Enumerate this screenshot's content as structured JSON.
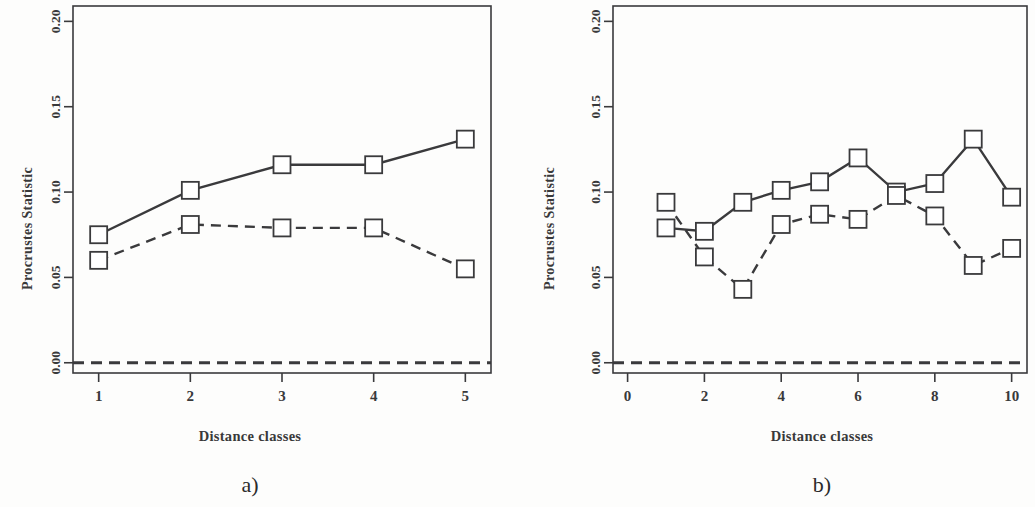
{
  "figure": {
    "background_color": "#fdfdfc",
    "ink_color": "#3a3a3c"
  },
  "panel_a": {
    "caption": "a)",
    "ylabel": "Procrustes Statistic",
    "xlabel": "Distance classes"
  },
  "panel_b": {
    "caption": "b)",
    "ylabel": "Procrustes Statistic",
    "xlabel": "Distance classes"
  },
  "chart_data": [
    {
      "type": "line",
      "panel": "a)",
      "title": "",
      "xlabel": "Distance classes",
      "ylabel": "Procrustes Statistic",
      "x": [
        1,
        2,
        3,
        4,
        5
      ],
      "xlim": [
        0.72,
        5.28
      ],
      "ylim": [
        -0.006,
        0.209
      ],
      "xticks": [
        1,
        2,
        3,
        4,
        5
      ],
      "xticklabels": [
        "1",
        "2",
        "3",
        "4",
        "5"
      ],
      "yticks": [
        0.0,
        0.05,
        0.1,
        0.15,
        0.2
      ],
      "yticklabels": [
        "0.00",
        "0.05",
        "0.10",
        "0.15",
        "0.20"
      ],
      "grid": false,
      "legend": "none",
      "marker": "open-square",
      "series": [
        {
          "name": "solid-series",
          "linestyle": "solid",
          "values": [
            0.075,
            0.101,
            0.116,
            0.116,
            0.131
          ]
        },
        {
          "name": "dashed-series",
          "linestyle": "dashed",
          "values": [
            0.06,
            0.081,
            0.079,
            0.079,
            0.055
          ]
        },
        {
          "name": "zero-reference-line",
          "linestyle": "dashed",
          "markers": false,
          "values": [
            0.0,
            0.0,
            0.0,
            0.0,
            0.0
          ]
        }
      ]
    },
    {
      "type": "line",
      "panel": "b)",
      "title": "",
      "xlabel": "Distance classes",
      "ylabel": "Procrustes Statistic",
      "x": [
        1,
        2,
        3,
        4,
        5,
        6,
        7,
        8,
        9,
        10
      ],
      "xlim": [
        -0.38,
        10.4
      ],
      "ylim": [
        -0.006,
        0.209
      ],
      "xticks": [
        0,
        2,
        4,
        6,
        8,
        10
      ],
      "xticklabels": [
        "0",
        "2",
        "4",
        "6",
        "8",
        "10"
      ],
      "yticks": [
        0.0,
        0.05,
        0.1,
        0.15,
        0.2
      ],
      "yticklabels": [
        "0.00",
        "0.05",
        "0.10",
        "0.15",
        "0.20"
      ],
      "grid": false,
      "legend": "none",
      "marker": "open-square",
      "series": [
        {
          "name": "solid-series",
          "linestyle": "solid",
          "values": [
            0.079,
            0.077,
            0.094,
            0.101,
            0.106,
            0.12,
            0.1,
            0.105,
            0.131,
            0.097
          ]
        },
        {
          "name": "dashed-series",
          "linestyle": "dashed",
          "values": [
            0.094,
            0.062,
            0.043,
            0.081,
            0.087,
            0.084,
            0.098,
            0.086,
            0.057,
            0.067
          ]
        },
        {
          "name": "zero-reference-line",
          "linestyle": "dashed",
          "markers": false,
          "values": [
            0.0,
            0.0,
            0.0,
            0.0,
            0.0,
            0.0,
            0.0,
            0.0,
            0.0,
            0.0
          ]
        }
      ]
    }
  ]
}
